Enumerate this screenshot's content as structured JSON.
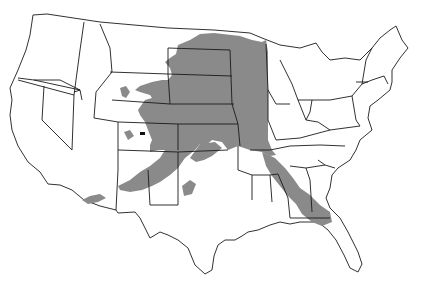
{
  "map": {
    "subject": "Contiguous United States species range map",
    "colors": {
      "background": "#ffffff",
      "state_fill": "#ffffff",
      "state_stroke": "#1a1a1a",
      "range_fill": "#8a8a8a",
      "marker": "#111111"
    },
    "layers": [
      {
        "name": "state-boundaries",
        "type": "outline"
      },
      {
        "name": "species-range",
        "type": "filled-area",
        "description": "Large shaded area over the Great Plains from the Canadian border south to Texas/Oklahoma, extending into Colorado/Wyoming and New Mexico/Arizona, with a southeastern arm through Tennessee, Alabama and Georgia"
      }
    ]
  }
}
